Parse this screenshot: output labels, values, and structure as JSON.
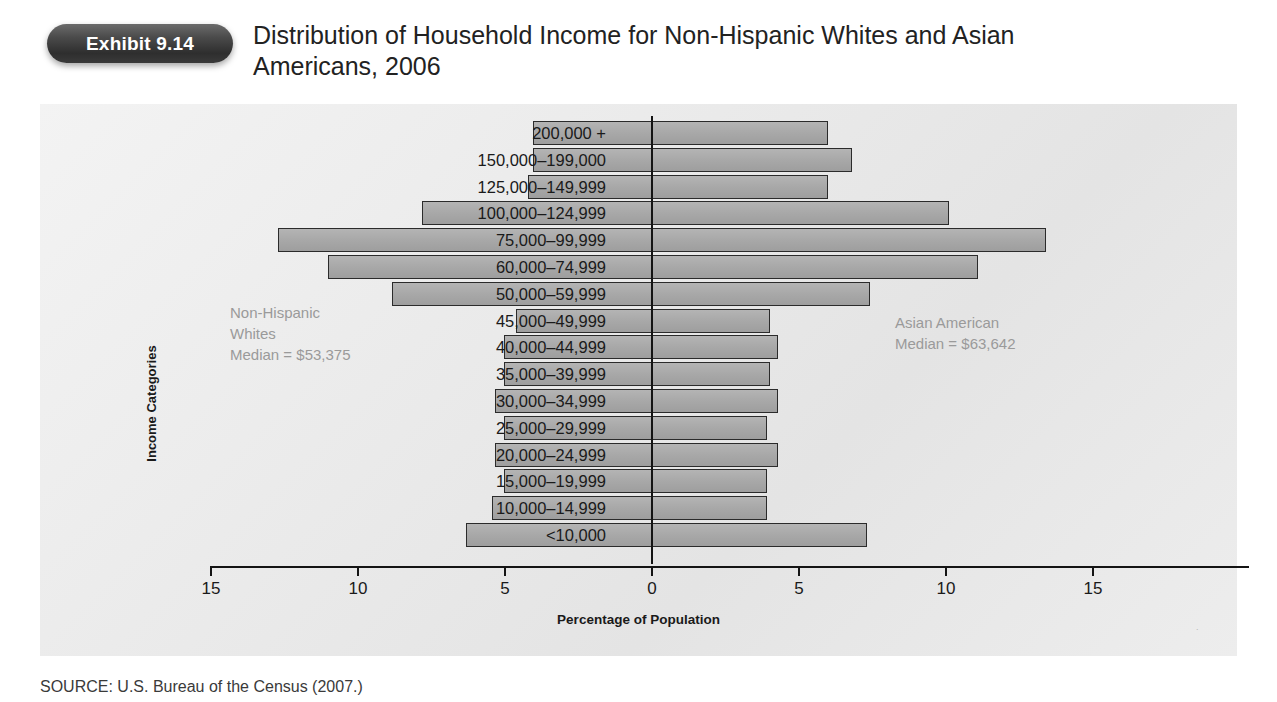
{
  "header": {
    "badge_label": "Exhibit 9.14",
    "title": "Distribution of Household Income for Non-Hispanic Whites and Asian Americans, 2006"
  },
  "annotations": {
    "left": "Non-Hispanic\nWhites\nMedian = $53,375",
    "right": "Asian American\nMedian = $63,642"
  },
  "source": "SOURCE: U.S. Bureau of the Census (2007.)",
  "chart_data": {
    "type": "bar",
    "orientation": "horizontal-pyramid",
    "title": "Distribution of Household Income for Non-Hispanic Whites and Asian Americans, 2006",
    "xlabel": "Percentage of Population",
    "ylabel": "Income Categories",
    "xlim": [
      -15,
      15
    ],
    "xticks": [
      15,
      10,
      5,
      0,
      5,
      10,
      15
    ],
    "grid": false,
    "legend_position": "inside-annotations",
    "categories": [
      "200,000 +",
      "150,000–199,000",
      "125,000–149,999",
      "100,000–124,999",
      "75,000–99,999",
      "60,000–74,999",
      "50,000–59,999",
      "45,000–49,999",
      "40,000–44,999",
      "35,000–39,999",
      "30,000–34,999",
      "25,000–29,999",
      "20,000–24,999",
      "15,000–19,999",
      "10,000–14,999",
      "<10,000"
    ],
    "series": [
      {
        "name": "Non-Hispanic Whites",
        "side": "left",
        "values": [
          4.0,
          4.0,
          4.2,
          7.8,
          12.7,
          11.0,
          8.8,
          4.6,
          5.0,
          5.0,
          5.3,
          5.0,
          5.3,
          5.0,
          5.4,
          6.3
        ]
      },
      {
        "name": "Asian American",
        "side": "right",
        "values": [
          6.0,
          6.8,
          6.0,
          10.1,
          13.4,
          11.1,
          7.4,
          4.0,
          4.3,
          4.0,
          4.3,
          3.9,
          4.3,
          3.9,
          3.9,
          7.3
        ]
      }
    ]
  },
  "colors": {
    "bar_fill": "#a8a8a8",
    "bar_stroke": "#2b2b2b",
    "panel_bg": "#ebebeb",
    "badge_bg": "#3a3a3a",
    "annotation_text": "#9a9a9a"
  }
}
